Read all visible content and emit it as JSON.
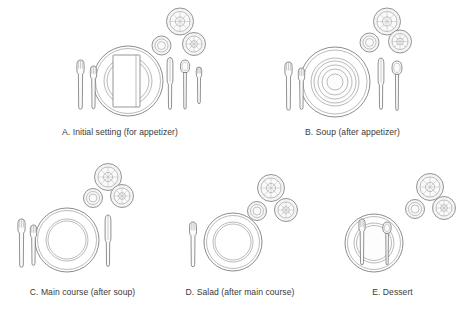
{
  "figure": {
    "background_color": "#ffffff",
    "line_color": "#6e6e6e",
    "caption_color": "#3a3a3a"
  },
  "settings": [
    {
      "id": "a",
      "caption": "A. Initial setting (for appetizer)",
      "items": [
        "charger-plate",
        "appetizer-plate",
        "folded-napkin",
        "dinner-fork",
        "salad-fork",
        "dinner-knife",
        "soup-spoon",
        "cocktail-fork",
        "wine-glass",
        "water-tumbler",
        "second-glass"
      ]
    },
    {
      "id": "b",
      "caption": "B. Soup (after appetizer)",
      "items": [
        "charger-plate",
        "soup-bowl",
        "dinner-fork",
        "salad-fork",
        "dinner-knife",
        "soup-spoon",
        "wine-glass",
        "water-tumbler",
        "second-glass"
      ]
    },
    {
      "id": "c",
      "caption": "C. Main course (after soup)",
      "items": [
        "dinner-plate",
        "dinner-fork",
        "salad-fork",
        "dinner-knife",
        "wine-glass",
        "water-tumbler",
        "second-glass"
      ]
    },
    {
      "id": "d",
      "caption": "D. Salad (after main course)",
      "items": [
        "salad-plate",
        "salad-fork",
        "wine-glass",
        "water-tumbler",
        "second-glass"
      ]
    },
    {
      "id": "e",
      "caption": "E. Dessert",
      "items": [
        "dessert-plate",
        "dessert-fork",
        "dessert-spoon",
        "wine-glass",
        "water-tumbler",
        "second-glass"
      ]
    }
  ]
}
